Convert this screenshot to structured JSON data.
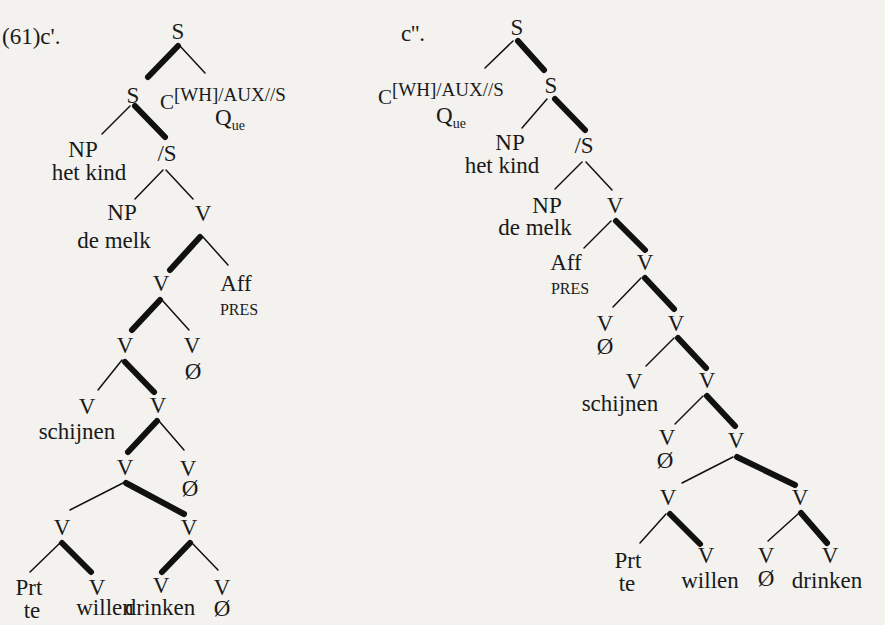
{
  "document": {
    "type": "syntax-trees",
    "example_number": "(61)"
  },
  "trees": [
    {
      "id": "c1",
      "label": "(61)c'.",
      "nodes": {
        "root": "S",
        "s2": "S",
        "comp_c": "C",
        "comp_feat": "[WH]/AUX//S",
        "comp_q": "Q",
        "comp_q_sub": "ue",
        "np1": "NP",
        "np1_word": "het kind",
        "slash_s": "/S",
        "np2": "NP",
        "np2_word": "de melk",
        "v1": "V",
        "v2": "V",
        "aff": "Aff",
        "aff_word": "PRES",
        "v3": "V",
        "v4": "V",
        "v4_word": "Ø",
        "v5": "V",
        "v5_word": "schijnen",
        "v6": "V",
        "v7": "V",
        "v8": "V",
        "v8_word": "Ø",
        "v9": "V",
        "v10": "V",
        "prt": "Prt",
        "prt_word": "te",
        "v11": "V",
        "v11_word": "willen",
        "v12": "V",
        "v12_word": "drinken",
        "v13": "V",
        "v13_word": "Ø"
      }
    },
    {
      "id": "c2",
      "label": "c''.",
      "nodes": {
        "root": "S",
        "comp_c": "C",
        "comp_feat": "[WH]/AUX//S",
        "comp_q": "Q",
        "comp_q_sub": "ue",
        "s2": "S",
        "np1": "NP",
        "np1_word": "het kind",
        "slash_s": "/S",
        "np2": "NP",
        "np2_word": "de melk",
        "v1": "V",
        "aff": "Aff",
        "aff_word": "PRES",
        "v2": "V",
        "v3": "V",
        "v3_word": "Ø",
        "v4": "V",
        "v5": "V",
        "v5_word": "schijnen",
        "v6": "V",
        "v7": "V",
        "v7_word": "Ø",
        "v8": "V",
        "v9": "V",
        "v10": "V",
        "prt": "Prt",
        "prt_word": "te",
        "v11": "V",
        "v11_word": "willen",
        "v12": "V",
        "v12_word": "Ø",
        "v13": "V",
        "v13_word": "drinken"
      }
    }
  ]
}
